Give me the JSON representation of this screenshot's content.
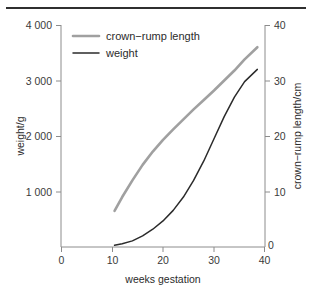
{
  "figure": {
    "rule_color": "#2f2f2f",
    "background": "#ffffff"
  },
  "chart_data": {
    "type": "line",
    "title": "",
    "subtitle": "",
    "xlabel": "weeks gestation",
    "ylabel": "weight/g",
    "y2label": "crown−rump length/cm",
    "xlim": [
      0,
      40
    ],
    "ylim": [
      0,
      4000
    ],
    "y2lim": [
      0,
      40
    ],
    "grid": false,
    "legend_position": "top-left inside axes",
    "xticks": [
      0,
      10,
      20,
      30,
      40
    ],
    "xtick_labels": [
      "0",
      "10",
      "20",
      "30",
      "40"
    ],
    "yticks": [
      1000,
      2000,
      3000,
      4000
    ],
    "ytick_labels": [
      "1 000",
      "2 000",
      "3 000",
      "4 000"
    ],
    "y2ticks": [
      0,
      10,
      20,
      30,
      40
    ],
    "y2tick_labels": [
      "0",
      "10",
      "20",
      "30",
      "40"
    ],
    "series": [
      {
        "name": "crown−rump length",
        "axis": "right",
        "unit": "cm",
        "color": "#a0a0a0",
        "line_width": 2.6,
        "x": [
          10.5,
          12,
          14,
          16,
          18,
          20,
          22,
          24,
          26,
          28,
          30,
          32,
          34,
          36,
          38.5
        ],
        "values": [
          6.5,
          9.0,
          12.0,
          14.8,
          17.2,
          19.3,
          21.2,
          23.0,
          24.8,
          26.5,
          28.2,
          30.0,
          31.8,
          33.8,
          36.0
        ]
      },
      {
        "name": "weight",
        "axis": "left",
        "unit": "g",
        "color": "#2b2b2b",
        "line_width": 1.5,
        "x": [
          10.5,
          12,
          14,
          16,
          18,
          20,
          22,
          24,
          26,
          28,
          30,
          32,
          34,
          36,
          38.5
        ],
        "values": [
          30,
          60,
          110,
          200,
          320,
          470,
          660,
          900,
          1200,
          1550,
          1950,
          2350,
          2700,
          2980,
          3200
        ]
      }
    ],
    "legend": [
      {
        "label": "crown−rump length",
        "color": "#a0a0a0",
        "line_width": 2.6
      },
      {
        "label": "weight",
        "color": "#2b2b2b",
        "line_width": 1.5
      }
    ]
  }
}
